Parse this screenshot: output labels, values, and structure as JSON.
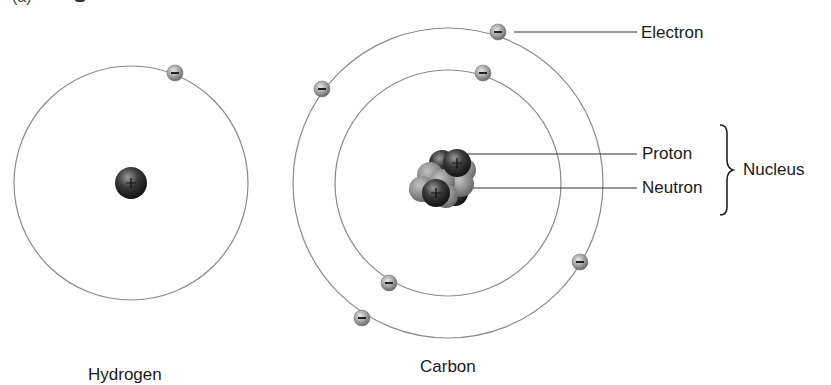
{
  "figure": {
    "partial_top_label": "(a)"
  },
  "atoms": [
    {
      "name": "Hydrogen",
      "label": "Hydrogen",
      "shells": 1,
      "electrons": 1,
      "protons": 1,
      "neutrons": 0
    },
    {
      "name": "Carbon",
      "label": "Carbon",
      "shells": 2,
      "electrons": 6,
      "protons": 6,
      "neutrons": 6
    }
  ],
  "callouts": {
    "electron": "Electron",
    "proton": "Proton",
    "neutron": "Neutron",
    "nucleus": "Nucleus"
  },
  "symbols": {
    "electron_charge": "−",
    "proton_charge": "+"
  },
  "colors": {
    "orbit": "#8a8a8a",
    "electron": "#9a9a9a",
    "proton": "#2b2b2b",
    "neutron": "#8c8c8c",
    "text": "#1a1a1a"
  }
}
